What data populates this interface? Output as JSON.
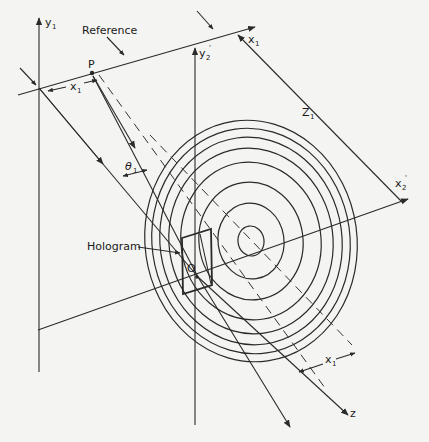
{
  "figure": {
    "labels": {
      "y1": "y",
      "y1_sub": "1",
      "reference": "Reference",
      "x1_top": "x",
      "x1_top_sub": "1",
      "p": "P",
      "x1_left": "x",
      "x1_left_sub": "1",
      "y2prime": "y",
      "y2prime_sub": "2",
      "y2prime_prime": "'",
      "z1": "Z",
      "z1_sub": "1",
      "theta1": "θ",
      "theta1_sub": "1",
      "x2prime": "x",
      "x2prime_sub": "2",
      "x2prime_prime": "'",
      "hologram": "Hologram",
      "origin": "O",
      "x1_bottom": "x",
      "x1_bottom_sub": "1",
      "z": "z"
    },
    "rings": {
      "center": [
        251,
        241
      ],
      "radii_x": [
        13,
        33,
        52,
        70,
        82,
        91,
        99,
        106
      ],
      "radii_y": [
        15,
        38,
        59,
        79,
        93,
        104,
        113,
        121
      ]
    },
    "colors": {
      "ink": "#2a2a2a",
      "paper": "#f4f4f2"
    }
  }
}
